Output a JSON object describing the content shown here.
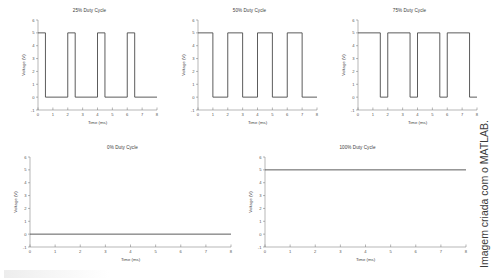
{
  "figure": {
    "credit": "Imagem criada com o MATLAB.",
    "line_color": "#4a4a4a",
    "axis_color": "#6e6e6e",
    "background": "#ffffff"
  },
  "axes_common": {
    "xlabel": "Time (ms)",
    "ylabel": "Voltage (V)",
    "xlim": [
      0,
      8
    ],
    "ylim": [
      -1,
      6
    ],
    "xticks": [
      "0",
      "1",
      "2",
      "3",
      "4",
      "5",
      "6",
      "7",
      "8"
    ],
    "yticks": [
      "-1",
      "0",
      "1",
      "2",
      "3",
      "4",
      "5",
      "6"
    ],
    "grid": "off"
  },
  "chart_data": [
    {
      "type": "line",
      "title": "25% Duty Cycle",
      "xlabel": "Time (ms)",
      "ylabel": "Voltage (V)",
      "xlim": [
        0,
        8
      ],
      "ylim": [
        -1,
        6
      ],
      "grid": "off",
      "duty_cycle_percent": 25,
      "period_ms": 2,
      "amplitude_v": 5,
      "x": [
        0,
        0.5,
        0.5,
        2.0,
        2.0,
        2.5,
        2.5,
        4.0,
        4.0,
        4.5,
        4.5,
        6.0,
        6.0,
        6.5,
        6.5,
        8.0
      ],
      "y": [
        5,
        5,
        0,
        0,
        5,
        5,
        0,
        0,
        5,
        5,
        0,
        0,
        5,
        5,
        0,
        0
      ]
    },
    {
      "type": "line",
      "title": "50% Duty Cycle",
      "xlabel": "Time (ms)",
      "ylabel": "Voltage (V)",
      "xlim": [
        0,
        8
      ],
      "ylim": [
        -1,
        6
      ],
      "grid": "off",
      "duty_cycle_percent": 50,
      "period_ms": 2,
      "amplitude_v": 5,
      "x": [
        0,
        1.0,
        1.0,
        2.0,
        2.0,
        3.0,
        3.0,
        4.0,
        4.0,
        5.0,
        5.0,
        6.0,
        6.0,
        7.0,
        7.0,
        8.0
      ],
      "y": [
        5,
        5,
        0,
        0,
        5,
        5,
        0,
        0,
        5,
        5,
        0,
        0,
        5,
        5,
        0,
        0
      ]
    },
    {
      "type": "line",
      "title": "75% Duty Cycle",
      "xlabel": "Time (ms)",
      "ylabel": "Voltage (V)",
      "xlim": [
        0,
        8
      ],
      "ylim": [
        -1,
        6
      ],
      "grid": "off",
      "duty_cycle_percent": 75,
      "period_ms": 2,
      "amplitude_v": 5,
      "x": [
        0,
        1.5,
        1.5,
        2.0,
        2.0,
        3.5,
        3.5,
        4.0,
        4.0,
        5.5,
        5.5,
        6.0,
        6.0,
        7.5,
        7.5,
        8.0
      ],
      "y": [
        5,
        5,
        0,
        0,
        5,
        5,
        0,
        0,
        5,
        5,
        0,
        0,
        5,
        5,
        0,
        0
      ]
    },
    {
      "type": "line",
      "title": "0% Duty Cycle",
      "xlabel": "Time (ms)",
      "ylabel": "Voltage (V)",
      "xlim": [
        0,
        8
      ],
      "ylim": [
        -1,
        6
      ],
      "grid": "off",
      "duty_cycle_percent": 0,
      "period_ms": 2,
      "amplitude_v": 5,
      "x": [
        0,
        8
      ],
      "y": [
        0,
        0
      ]
    },
    {
      "type": "line",
      "title": "100% Duty Cycle",
      "xlabel": "Time (ms)",
      "ylabel": "Voltage (V)",
      "xlim": [
        0,
        8
      ],
      "ylim": [
        -1,
        6
      ],
      "grid": "off",
      "duty_cycle_percent": 100,
      "period_ms": 2,
      "amplitude_v": 5,
      "x": [
        0,
        8
      ],
      "y": [
        5,
        5
      ]
    }
  ],
  "panels": [
    {
      "index": 0,
      "left": 18,
      "top": 6,
      "width": 143,
      "height": 130
    },
    {
      "index": 1,
      "left": 178,
      "top": 6,
      "width": 143,
      "height": 130
    },
    {
      "index": 2,
      "left": 338,
      "top": 6,
      "width": 143,
      "height": 130
    },
    {
      "index": 3,
      "left": 10,
      "top": 143,
      "width": 225,
      "height": 130
    },
    {
      "index": 4,
      "left": 245,
      "top": 143,
      "width": 225,
      "height": 130
    }
  ]
}
